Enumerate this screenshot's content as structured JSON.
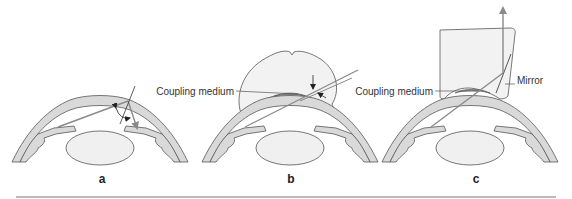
{
  "panels": [
    {
      "id": "a",
      "label": "a"
    },
    {
      "id": "b",
      "label": "b",
      "annotations": {
        "coupling_medium": "Coupling medium"
      }
    },
    {
      "id": "c",
      "label": "c",
      "annotations": {
        "coupling_medium": "Coupling medium",
        "mirror": "Mirror"
      }
    }
  ],
  "colors": {
    "tissue_fill": "#d9d9d9",
    "lens_fill": "#f0f0f0",
    "outline": "#555555",
    "ray": "#8a8a8a",
    "contact_lens_fill": "#f2f2f2",
    "rule": "#bbbbbb"
  }
}
